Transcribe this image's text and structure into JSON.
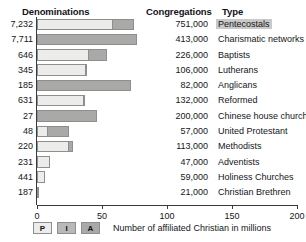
{
  "header": {
    "denominations": "Denominations",
    "congregations": "Congregations",
    "type": "Type"
  },
  "legend": {
    "items": [
      {
        "key": "P",
        "label": "P",
        "color": "#ececeb"
      },
      {
        "key": "I",
        "label": "I",
        "color": "#b9b9b8"
      },
      {
        "key": "A",
        "label": "A",
        "color": "#a9a9a8"
      }
    ],
    "caption": "Number of affiliated Christian in millions"
  },
  "axis": {
    "ticks": [
      "0",
      "50",
      "100",
      "150",
      "200"
    ],
    "min": 0,
    "max": 200
  },
  "chart_data": {
    "type": "bar",
    "title": "",
    "subtitle": "",
    "xlabel": "Number of affiliated Christian in millions",
    "ylabel": "",
    "xlim": [
      0,
      200
    ],
    "grid": false,
    "orientation": "horizontal",
    "stacked": true,
    "legend_position": "bottom-left",
    "categories": [
      "Pentecostals",
      "Charismatic networks",
      "Baptists",
      "Lutherans",
      "Anglicans",
      "Reformed",
      "Chinese house churches",
      "United Protestant",
      "Methodists",
      "Adventists",
      "Holiness Churches",
      "Christian Brethren"
    ],
    "series": [
      {
        "name": "P",
        "values": [
          58,
          0,
          39,
          37,
          0,
          35,
          0,
          8,
          24,
          10,
          6,
          1
        ]
      },
      {
        "name": "I",
        "values": [
          0,
          0,
          0,
          0,
          0,
          0,
          0,
          0,
          0,
          0,
          0,
          0
        ]
      },
      {
        "name": "A",
        "values": [
          17,
          77,
          15,
          1.5,
          72,
          2,
          46,
          17,
          4,
          0,
          0,
          0
        ]
      }
    ],
    "rows": [
      {
        "denominations": "7,232",
        "congregations": "751,000",
        "type": "Pentecostals",
        "segments": [
          {
            "series": "P",
            "value": 58
          },
          {
            "series": "A",
            "value": 17
          }
        ],
        "total": 75,
        "highlight": true
      },
      {
        "denominations": "7,711",
        "congregations": "413,000",
        "type": "Charismatic networks",
        "segments": [
          {
            "series": "A",
            "value": 77
          }
        ],
        "total": 77,
        "highlight": false
      },
      {
        "denominations": "646",
        "congregations": "226,000",
        "type": "Baptists",
        "segments": [
          {
            "series": "P",
            "value": 39
          },
          {
            "series": "A",
            "value": 15
          }
        ],
        "total": 54,
        "highlight": false
      },
      {
        "denominations": "345",
        "congregations": "106,000",
        "type": "Lutherans",
        "segments": [
          {
            "series": "P",
            "value": 37
          },
          {
            "series": "A",
            "value": 1.5
          }
        ],
        "total": 38.5,
        "highlight": false
      },
      {
        "denominations": "185",
        "congregations": "82,000",
        "type": "Anglicans",
        "segments": [
          {
            "series": "A",
            "value": 72
          }
        ],
        "total": 72,
        "highlight": false
      },
      {
        "denominations": "631",
        "congregations": "132,000",
        "type": "Reformed",
        "segments": [
          {
            "series": "P",
            "value": 35
          },
          {
            "series": "A",
            "value": 2
          }
        ],
        "total": 37,
        "highlight": false
      },
      {
        "denominations": "27",
        "congregations": "200,000",
        "type": "Chinese house churches",
        "segments": [
          {
            "series": "A",
            "value": 46
          }
        ],
        "total": 46,
        "highlight": false
      },
      {
        "denominations": "48",
        "congregations": "57,000",
        "type": "United Protestant",
        "segments": [
          {
            "series": "P",
            "value": 8
          },
          {
            "series": "A",
            "value": 17
          }
        ],
        "total": 25,
        "highlight": false
      },
      {
        "denominations": "220",
        "congregations": "113,000",
        "type": "Methodists",
        "segments": [
          {
            "series": "P",
            "value": 24
          },
          {
            "series": "A",
            "value": 4
          }
        ],
        "total": 28,
        "highlight": false
      },
      {
        "denominations": "231",
        "congregations": "47,000",
        "type": "Adventists",
        "segments": [
          {
            "series": "P",
            "value": 10
          }
        ],
        "total": 10,
        "highlight": false
      },
      {
        "denominations": "441",
        "congregations": "59,000",
        "type": "Holiness Churches",
        "segments": [
          {
            "series": "P",
            "value": 6
          }
        ],
        "total": 6,
        "highlight": false
      },
      {
        "denominations": "187",
        "congregations": "21,000",
        "type": "Christian Brethren",
        "segments": [
          {
            "series": "P",
            "value": 1
          }
        ],
        "total": 1,
        "highlight": false
      }
    ]
  }
}
